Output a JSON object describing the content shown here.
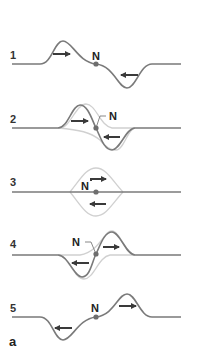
{
  "figure": {
    "label": "a",
    "node_label": "N",
    "colors": {
      "wave": "#7a7a7a",
      "ghost_wave": "#d0d0d0",
      "arrow": "#3a3a3a",
      "node_dot": "#6e6e6e",
      "text": "#222222"
    },
    "panels": [
      {
        "number": "1",
        "description": "Upward pulse moving right, downward pulse moving left, approaching node N"
      },
      {
        "number": "2",
        "description": "Pulses begin to overlap near node N"
      },
      {
        "number": "3",
        "description": "Complete cancellation; string flat at node N"
      },
      {
        "number": "4",
        "description": "Pulses pass through each other"
      },
      {
        "number": "5",
        "description": "Downward pulse moving left, upward pulse moving right, leaving node N"
      }
    ]
  }
}
